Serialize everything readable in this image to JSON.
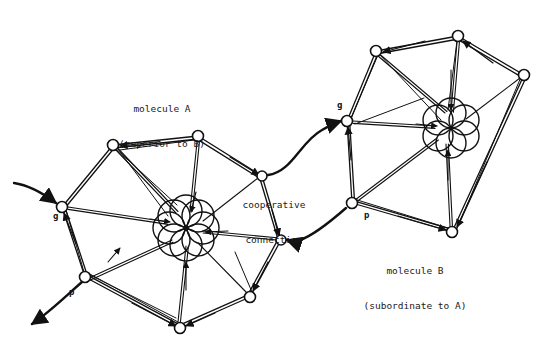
{
  "figure": {
    "background_color": "#ffffff",
    "ink_color": "#111111",
    "width": 548,
    "height": 355
  },
  "labels": {
    "molecule_a": "molecule A\n(superior to B)",
    "molecule_a_line1": "molecule A",
    "molecule_a_line2": "(superior to B)",
    "molecule_b": "molecule B\n(subordinate to A)",
    "molecule_b_line1": "molecule B",
    "molecule_b_line2": "(subordinate to A)",
    "cooperative_connection": "cooperative\nconnection",
    "cooperative_line1": "cooperative",
    "cooperative_line2": "connection",
    "g_left": "g",
    "p_left": "p",
    "g_right": "g",
    "p_right": "p"
  },
  "label_positions": {
    "molecule_a": {
      "x": 140,
      "y": 86
    },
    "cooperative_connection": {
      "x": 272,
      "y": 181
    },
    "molecule_b": {
      "x": 414,
      "y": 248
    },
    "g_left": {
      "x": 55,
      "y": 215
    },
    "p_left": {
      "x": 71,
      "y": 291
    },
    "g_right": {
      "x": 339,
      "y": 104
    },
    "p_right": {
      "x": 366,
      "y": 214
    }
  },
  "molecule_a": {
    "name": "molecule A",
    "role": "superior to B",
    "node_count": 8,
    "center": {
      "x": 186,
      "y": 228
    },
    "rosette_circle_count": 8,
    "rosette_radius": 16,
    "rosette_ring_radius": 17,
    "nodes": [
      {
        "id": "g",
        "label": "g",
        "x": 62,
        "y": 207,
        "r": 5.5
      },
      {
        "id": "n1",
        "label": "",
        "x": 113,
        "y": 145,
        "r": 5.5
      },
      {
        "id": "n2",
        "label": "",
        "x": 198,
        "y": 136,
        "r": 5.5
      },
      {
        "id": "n3",
        "label": "",
        "x": 262,
        "y": 176,
        "r": 5.0
      },
      {
        "id": "n4",
        "label": "",
        "x": 281,
        "y": 240,
        "r": 5.0
      },
      {
        "id": "n5",
        "label": "",
        "x": 250,
        "y": 297,
        "r": 5.5
      },
      {
        "id": "n6",
        "label": "",
        "x": 180,
        "y": 328,
        "r": 5.5
      },
      {
        "id": "p",
        "label": "p",
        "x": 85,
        "y": 277,
        "r": 5.5
      }
    ]
  },
  "molecule_b": {
    "name": "molecule B",
    "role": "subordinate to A",
    "node_count": 6,
    "center": {
      "x": 451,
      "y": 128
    },
    "rosette_circle_count": 6,
    "rosette_radius": 15,
    "rosette_ring_radius": 15,
    "nodes": [
      {
        "id": "g",
        "label": "g",
        "x": 347,
        "y": 121,
        "r": 5.5
      },
      {
        "id": "m1",
        "label": "",
        "x": 376,
        "y": 51,
        "r": 5.5
      },
      {
        "id": "m2",
        "label": "",
        "x": 458,
        "y": 36,
        "r": 5.5
      },
      {
        "id": "m3",
        "label": "",
        "x": 524,
        "y": 75,
        "r": 5.5
      },
      {
        "id": "m4",
        "label": "",
        "x": 452,
        "y": 232,
        "r": 5.5
      },
      {
        "id": "p",
        "label": "p",
        "x": 352,
        "y": 203,
        "r": 5.5
      }
    ]
  },
  "connections": {
    "upper": {
      "from": "molecule_a.n3",
      "to": "molecule_b.g",
      "arrow_at": "molecule_b.g",
      "description": "cooperative connection, A to B"
    },
    "lower": {
      "from": "molecule_b.p",
      "to": "molecule_a.n4",
      "arrow_at": "molecule_a.n4",
      "description": "cooperative connection, B to A"
    }
  },
  "free_tendrils": [
    {
      "id": "in-g",
      "target": "molecule_a.g",
      "arrow_at": "node",
      "description": "incoming tendril to g of molecule A"
    },
    {
      "id": "out-p",
      "source": "molecule_a.p",
      "arrow_at": "free-end",
      "description": "outgoing tendril from p of molecule A"
    }
  ]
}
